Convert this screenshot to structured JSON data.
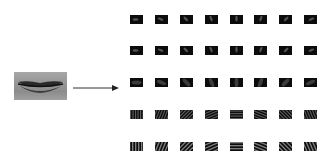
{
  "diagram": {
    "input_image": {
      "label": "lip-region",
      "x": 14,
      "y": 72,
      "w": 53,
      "h": 28
    },
    "arrow": {
      "from": [
        73,
        88
      ],
      "to": [
        118,
        88
      ]
    },
    "grid": {
      "rows": 5,
      "cols": 8,
      "col_x": [
        130,
        155,
        180,
        205,
        230,
        254,
        279,
        304
      ],
      "row_y": [
        15,
        46,
        78,
        110,
        142
      ],
      "thumb_w": 13,
      "thumb_h": 9,
      "row_patterns": [
        "blob",
        "blob",
        "soft",
        "stripes-fine",
        "stripes-coarse"
      ],
      "orientations_deg": [
        0,
        22,
        45,
        67,
        90,
        112,
        135,
        157
      ]
    },
    "colors": {
      "background": "#ffffff",
      "thumb": "#0c0c0c",
      "arrow": "#333333"
    }
  }
}
